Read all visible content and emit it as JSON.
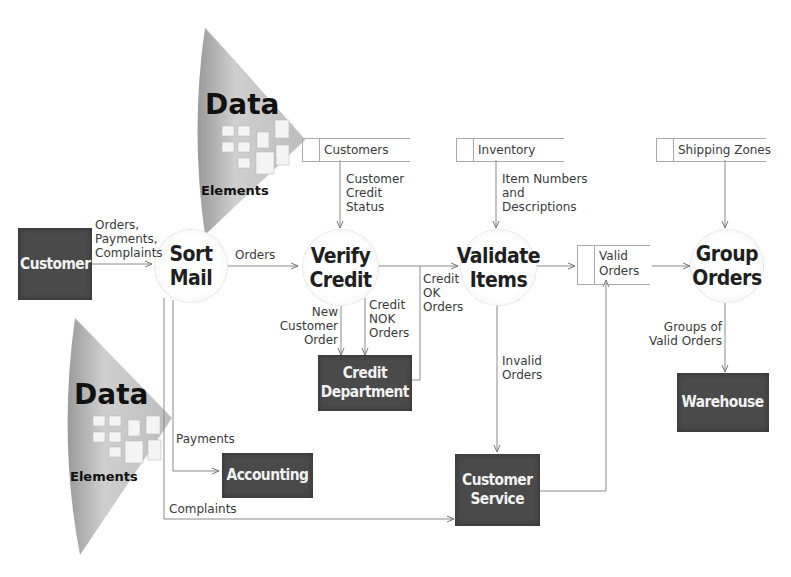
{
  "diagram": {
    "type": "data flow diagram",
    "fans": [
      {
        "id": "fan-top",
        "title": "Data",
        "subtitle": "Elements"
      },
      {
        "id": "fan-bottom",
        "title": "Data",
        "subtitle": "Elements"
      }
    ],
    "entities": {
      "customer": "Customer",
      "credit_department": "Credit\nDepartment",
      "accounting": "Accounting",
      "customer_service": "Customer\nService",
      "warehouse": "Warehouse"
    },
    "processes": {
      "sort_mail": "Sort\nMail",
      "verify_credit": "Verify\nCredit",
      "validate_items": "Validate\nItems",
      "group_orders": "Group\nOrders"
    },
    "data_stores": {
      "customers": "Customers",
      "inventory": "Inventory",
      "shipping_zones": "Shipping Zones",
      "valid_orders": "Valid\nOrders"
    },
    "flows": {
      "customer_to_sort": "Orders,\nPayments,\nComplaints",
      "sort_to_verify": "Orders",
      "customers_to_verify": "Customer\nCredit\nStatus",
      "new_customer_order": "New\nCustomer\nOrder",
      "credit_nok": "Credit\nNOK\nOrders",
      "credit_ok": "Credit\nOK\nOrders",
      "inventory_to_validate": "Item Numbers\nand\nDescriptions",
      "invalid_orders": "Invalid\nOrders",
      "groups_valid_orders": "Groups of\nValid Orders",
      "payments": "Payments",
      "complaints": "Complaints"
    }
  }
}
